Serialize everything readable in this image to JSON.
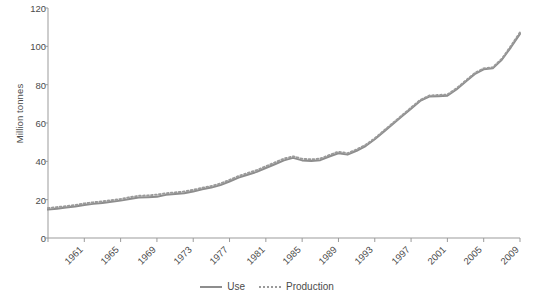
{
  "chart_data": {
    "type": "line",
    "title": "",
    "xlabel": "",
    "ylabel": "Million tonnes",
    "ylim": [
      0,
      120
    ],
    "ytick_values": [
      0,
      20,
      40,
      60,
      80,
      100,
      120
    ],
    "xlim": [
      1961,
      2013
    ],
    "xtick_labels": [
      "1961",
      "1965",
      "1969",
      "1973",
      "1977",
      "1981",
      "1985",
      "1989",
      "1993",
      "1997",
      "2001",
      "2005",
      "2009",
      "2013"
    ],
    "xtick_values": [
      1961,
      1965,
      1969,
      1973,
      1977,
      1981,
      1985,
      1989,
      1993,
      1997,
      2001,
      2005,
      2009,
      2013
    ],
    "grid": false,
    "legend_position": "bottom-center",
    "x": [
      1961,
      1962,
      1963,
      1964,
      1965,
      1966,
      1967,
      1968,
      1969,
      1970,
      1971,
      1972,
      1973,
      1974,
      1975,
      1976,
      1977,
      1978,
      1979,
      1980,
      1981,
      1982,
      1983,
      1984,
      1985,
      1986,
      1987,
      1988,
      1989,
      1990,
      1991,
      1992,
      1993,
      1994,
      1995,
      1996,
      1997,
      1998,
      1999,
      2000,
      2001,
      2002,
      2003,
      2004,
      2005,
      2006,
      2007,
      2008,
      2009,
      2010,
      2011,
      2012,
      2013
    ],
    "series": [
      {
        "name": "Use",
        "style": "solid",
        "color": "#8d8d8d",
        "values": [
          14.8,
          15.3,
          15.9,
          16.4,
          17.2,
          17.8,
          18.3,
          18.9,
          19.5,
          20.4,
          21.1,
          21.3,
          21.5,
          22.5,
          23.0,
          23.4,
          24.3,
          25.4,
          26.3,
          27.6,
          29.5,
          31.5,
          33.0,
          34.5,
          36.5,
          38.5,
          40.5,
          41.8,
          40.5,
          40.2,
          40.6,
          42.5,
          44.2,
          43.5,
          45.5,
          48.0,
          51.5,
          55.5,
          59.5,
          63.5,
          67.5,
          71.5,
          73.8,
          74.0,
          74.2,
          77.5,
          81.5,
          85.5,
          88.0,
          88.5,
          93.0,
          99.5,
          106.5
        ]
      },
      {
        "name": "Production",
        "style": "dotted",
        "color": "#9a9a9a",
        "values": [
          15.6,
          16.1,
          16.6,
          17.2,
          18.0,
          18.6,
          19.1,
          19.7,
          20.3,
          21.3,
          22.0,
          22.2,
          22.6,
          23.3,
          23.8,
          24.2,
          25.1,
          26.2,
          27.1,
          28.4,
          30.3,
          32.3,
          33.9,
          35.4,
          37.4,
          39.4,
          41.4,
          42.6,
          41.3,
          41.0,
          41.4,
          43.3,
          45.0,
          44.2,
          46.2,
          48.6,
          52.0,
          56.0,
          60.0,
          64.0,
          68.0,
          72.0,
          74.3,
          74.6,
          74.8,
          78.1,
          82.0,
          86.0,
          88.5,
          89.0,
          93.5,
          100.2,
          107.3
        ]
      }
    ],
    "legend": [
      {
        "label": "Use",
        "style": "solid"
      },
      {
        "label": "Production",
        "style": "dotted"
      }
    ]
  },
  "axes": {
    "axis_color": "#9b9b9b",
    "tick_color": "#9b9b9b",
    "text_color": "#4b4b4b"
  }
}
